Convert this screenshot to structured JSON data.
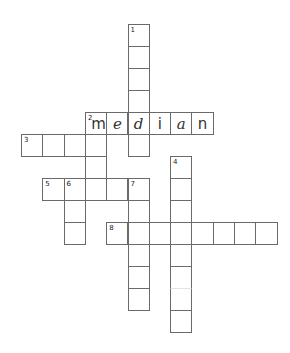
{
  "puzzle": {
    "type": "crossword",
    "grid": {
      "origin_x": 21,
      "origin_y": 24,
      "cell_w": 21.3,
      "cell_h": 22,
      "line_color": "#6a6a6a"
    },
    "entries": [
      {
        "number": "1",
        "direction": "down",
        "row": 0,
        "col": 5,
        "length": 6,
        "letters": []
      },
      {
        "number": "2",
        "direction": "across",
        "row": 4,
        "col": 3,
        "length": 6,
        "letters": [
          "m",
          "e",
          "d",
          "i",
          "a",
          "n"
        ]
      },
      {
        "number": "2",
        "direction": "down",
        "row": 4,
        "col": 3,
        "length": 4,
        "letters": [
          "m"
        ]
      },
      {
        "number": "3",
        "direction": "across",
        "row": 5,
        "col": 0,
        "length": 4,
        "letters": []
      },
      {
        "number": "4",
        "direction": "down",
        "row": 6,
        "col": 7,
        "length": 8,
        "letters": []
      },
      {
        "number": "5",
        "direction": "across",
        "row": 7,
        "col": 1,
        "length": 5,
        "letters": []
      },
      {
        "number": "6",
        "direction": "down",
        "row": 7,
        "col": 2,
        "length": 3,
        "letters": []
      },
      {
        "number": "7",
        "direction": "down",
        "row": 7,
        "col": 5,
        "length": 6,
        "letters": []
      },
      {
        "number": "8",
        "direction": "across",
        "row": 9,
        "col": 4,
        "length": 8,
        "letters": []
      }
    ],
    "filled_word": "median"
  }
}
